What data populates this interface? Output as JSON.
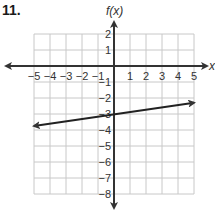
{
  "problem_number": "11.",
  "chart_data": {
    "type": "line",
    "title": "",
    "xlabel": "x",
    "ylabel": "f(x)",
    "xlim": [
      -5,
      5
    ],
    "ylim": [
      -8,
      2
    ],
    "grid": true,
    "x_ticks": [
      "-5",
      "-4",
      "-3",
      "-2",
      "-1",
      "1",
      "2",
      "3",
      "4",
      "5"
    ],
    "y_ticks": [
      "2",
      "1",
      "-1",
      "-2",
      "-3",
      "-4",
      "-5",
      "-6",
      "-7",
      "-8"
    ],
    "series": [
      {
        "name": "f(x)",
        "x": [
          -5,
          0,
          5
        ],
        "y": [
          -3.75,
          -3,
          -2.3
        ],
        "arrows_both_ends": true
      }
    ],
    "colors": {
      "grid": "#c8c8c8",
      "axis": "#333333",
      "line": "#222222"
    }
  }
}
